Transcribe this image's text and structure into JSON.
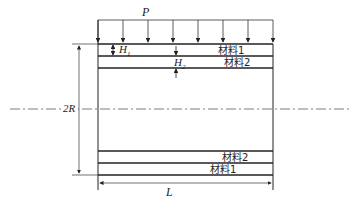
{
  "diagram": {
    "load_label": "P",
    "layer1_thickness_label": "H",
    "layer1_thickness_sub": "1",
    "layer2_thickness_label": "H",
    "layer2_thickness_sub": "2",
    "diameter_label": "2R",
    "length_label": "L",
    "layers": {
      "top_outer": "材料1",
      "top_inner": "材料2",
      "bottom_inner": "材料2",
      "bottom_outer": "材料1"
    },
    "load_arrow_count": 8
  }
}
